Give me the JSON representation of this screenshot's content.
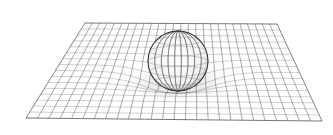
{
  "figure": {
    "background": "#ffffff",
    "grid_color": "#555555",
    "sphere_outline_color": "#333333",
    "plane": {
      "corners": {
        "top_left": [
          85,
          23
        ],
        "top_right": [
          277,
          24
        ],
        "bottom_right": [
          322,
          121
        ],
        "bottom_left": [
          26,
          118
        ]
      },
      "columns": 26,
      "rows": 16
    },
    "dent": {
      "center_u": 0.5,
      "center_v": 0.52,
      "depth_px": 18,
      "radius": 0.17
    },
    "sphere": {
      "cx": 178,
      "cy": 61,
      "r": 30,
      "meridians": 9,
      "parallels": 6
    }
  }
}
